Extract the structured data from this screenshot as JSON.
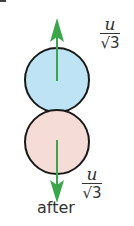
{
  "diagram": {
    "top_ball": {
      "fill": "#bde3f4",
      "stroke": "#1a1a1a",
      "label": ""
    },
    "bottom_ball": {
      "fill": "#f5dcd6",
      "stroke": "#1a1a1a",
      "label": ""
    },
    "arrow_color": "#3aa64a",
    "top_velocity": {
      "numerator": "u",
      "denominator": "√3",
      "direction": "up"
    },
    "bottom_velocity": {
      "numerator": "u",
      "denominator": "√3",
      "direction": "down"
    },
    "caption": "after"
  }
}
